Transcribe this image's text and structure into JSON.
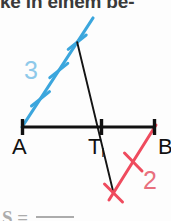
{
  "figure": {
    "type": "geometry-construction",
    "caption_top": "ke in einem be-",
    "caption_bottom_prefix": "S",
    "caption_bottom_mid": "=",
    "background_color": "#fdfdfd"
  },
  "colors": {
    "baseline": "#111111",
    "transversal": "#141414",
    "blue_ray": "#3ba6dd",
    "blue_label": "#8ec9ea",
    "red_ray": "#ef4b5e",
    "red_label": "#e8707e",
    "label_text": "#111111"
  },
  "points": {
    "A": {
      "label": "A",
      "x": 22,
      "y": 127
    },
    "T": {
      "label": "T",
      "sub": "i",
      "x": 101,
      "y": 127
    },
    "B": {
      "label": "B",
      "x": 155,
      "y": 127
    }
  },
  "baseline": {
    "name": "segment-AB",
    "x1": 22,
    "y1": 127,
    "x2": 155,
    "y2": 127,
    "tick_half_height": 8,
    "stroke_width": 3
  },
  "blue_ray": {
    "name": "ray-from-A-3-units",
    "label": "3",
    "unit_count": 3,
    "x1": 22,
    "y1": 127,
    "x2": 93,
    "y2": 18,
    "tick_points": [
      {
        "x": 40.5,
        "y": 98.8
      },
      {
        "x": 58.8,
        "y": 70.5
      },
      {
        "x": 77.2,
        "y": 42.2
      }
    ],
    "stroke_width": 3.2
  },
  "red_ray": {
    "name": "ray-from-B-2-units",
    "label": "2",
    "unit_count": 2,
    "x1": 155,
    "y1": 127,
    "x2": 111,
    "y2": 197,
    "tick_points": [
      {
        "x": 133.0,
        "y": 162.0
      },
      {
        "x": 113.5,
        "y": 193.0
      }
    ],
    "stroke_width": 3.0
  },
  "transversal": {
    "name": "line-through-Ti",
    "x1": 77.2,
    "y1": 42.2,
    "x2": 113.5,
    "y2": 193.0,
    "stroke_width": 1.8
  },
  "ratio": {
    "left": "3",
    "right": "2",
    "text": "3 : 2"
  }
}
